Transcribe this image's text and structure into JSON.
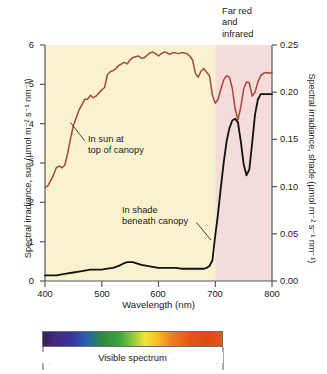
{
  "chart_data": {
    "type": "line",
    "title": "",
    "xlabel": "Wavelength (nm)",
    "ylabel": "Spectral irradiance, sun (µmol m⁻² s⁻¹ nm⁻¹)",
    "ylabel_right": "Spectral irradiance, shade (µmol m⁻² s⁻¹ nm⁻¹)",
    "xlim": [
      400,
      800
    ],
    "ylim": [
      0,
      6
    ],
    "ylim_right": [
      0.0,
      0.25
    ],
    "xticks": [
      400,
      500,
      600,
      700,
      800
    ],
    "xticklabels": [
      "400",
      "500",
      "600",
      "700",
      "800"
    ],
    "yticks": [
      0,
      1,
      2,
      3,
      4,
      5,
      6
    ],
    "yticklabels": [
      "0",
      "1",
      "2",
      "3",
      "4",
      "5",
      "6"
    ],
    "yticks_right": [
      0.0,
      0.05,
      0.1,
      0.15,
      0.2,
      0.25
    ],
    "yticklabels_right": [
      "0.00",
      "0.05",
      "0.10",
      "0.15",
      "0.20",
      "0.25"
    ],
    "grid": false,
    "legend_position": "inline-annotations",
    "series": [
      {
        "name": "In sun at top of canopy",
        "axis": "left",
        "color": "#a8443a",
        "x": [
          400,
          405,
          410,
          415,
          420,
          425,
          430,
          435,
          440,
          445,
          450,
          455,
          460,
          465,
          470,
          475,
          480,
          485,
          490,
          495,
          500,
          505,
          510,
          515,
          520,
          525,
          530,
          535,
          540,
          545,
          550,
          555,
          560,
          565,
          570,
          575,
          580,
          585,
          590,
          595,
          600,
          605,
          610,
          615,
          620,
          625,
          630,
          635,
          640,
          645,
          650,
          655,
          660,
          665,
          670,
          675,
          680,
          685,
          690,
          695,
          700,
          705,
          710,
          715,
          720,
          725,
          730,
          735,
          740,
          745,
          750,
          755,
          760,
          765,
          770,
          775,
          780,
          785,
          790,
          795,
          800
        ],
        "y": [
          2.38,
          2.42,
          2.55,
          2.7,
          2.88,
          2.92,
          2.88,
          2.95,
          3.25,
          3.62,
          3.95,
          4.15,
          4.35,
          4.48,
          4.62,
          4.62,
          4.72,
          4.66,
          4.7,
          4.78,
          4.86,
          4.92,
          5.25,
          5.32,
          5.35,
          5.4,
          5.48,
          5.52,
          5.56,
          5.52,
          5.62,
          5.68,
          5.7,
          5.72,
          5.66,
          5.68,
          5.74,
          5.8,
          5.82,
          5.78,
          5.72,
          5.78,
          5.82,
          5.8,
          5.76,
          5.8,
          5.8,
          5.78,
          5.8,
          5.8,
          5.78,
          5.72,
          5.62,
          5.28,
          5.18,
          5.34,
          5.4,
          5.3,
          5.22,
          4.72,
          4.52,
          4.62,
          4.88,
          5.12,
          5.22,
          5.18,
          4.9,
          4.38,
          4.1,
          4.42,
          4.88,
          5.06,
          5.04,
          4.7,
          4.8,
          5.05,
          5.22,
          5.28,
          5.3,
          5.28,
          5.3
        ]
      },
      {
        "name": "In shade beneath canopy",
        "axis": "right",
        "color": "#111111",
        "x": [
          400,
          410,
          420,
          430,
          440,
          450,
          460,
          470,
          480,
          490,
          500,
          510,
          520,
          530,
          540,
          545,
          550,
          555,
          560,
          570,
          580,
          590,
          600,
          610,
          620,
          630,
          640,
          650,
          660,
          670,
          675,
          680,
          685,
          690,
          695,
          700,
          705,
          710,
          715,
          720,
          725,
          730,
          735,
          740,
          745,
          750,
          755,
          760,
          765,
          770,
          775,
          780,
          785,
          790,
          795,
          800
        ],
        "y": [
          0.006,
          0.006,
          0.006,
          0.007,
          0.008,
          0.009,
          0.01,
          0.011,
          0.012,
          0.012,
          0.012,
          0.013,
          0.014,
          0.016,
          0.019,
          0.02,
          0.02,
          0.02,
          0.019,
          0.017,
          0.016,
          0.015,
          0.014,
          0.014,
          0.014,
          0.014,
          0.013,
          0.013,
          0.013,
          0.013,
          0.013,
          0.013,
          0.014,
          0.016,
          0.022,
          0.048,
          0.072,
          0.1,
          0.126,
          0.148,
          0.162,
          0.17,
          0.172,
          0.168,
          0.148,
          0.124,
          0.112,
          0.118,
          0.146,
          0.176,
          0.192,
          0.198,
          0.198,
          0.198,
          0.198,
          0.198
        ]
      }
    ],
    "regions": [
      {
        "name": "visible-band-shading",
        "x0": 400,
        "x1": 700,
        "color": "#f9f2cf"
      },
      {
        "name": "far-red-infrared-shading",
        "x0": 700,
        "x1": 800,
        "color": "#f4dcda"
      }
    ],
    "annotations": [
      {
        "name": "far-red-and-infrared",
        "lines": [
          "Far red",
          "and",
          "infrared"
        ]
      },
      {
        "name": "in-sun-at-top-of-canopy",
        "lines": [
          "In sun at",
          "top of canopy"
        ]
      },
      {
        "name": "in-shade-beneath-canopy",
        "lines": [
          "In shade",
          "beneath canopy"
        ]
      }
    ],
    "spectrum_strip": {
      "caption": "Visible spectrum",
      "range_nm": [
        400,
        700
      ],
      "colors": [
        "#3b1d5e",
        "#3636a0",
        "#2b5fb4",
        "#3aa03c",
        "#8cc63f",
        "#f2e33a",
        "#f7c32a",
        "#ef7d1e",
        "#dd4a18"
      ]
    }
  },
  "axes": {
    "left_title": "Spectral irradiance, sun (µmol m⁻² s⁻¹ nm⁻¹)",
    "right_title": "Spectral irradiance, shade (µmol m⁻² s⁻¹ nm⁻¹)",
    "x_title": "Wavelength (nm)",
    "left_ticks": [
      "6",
      "5",
      "4",
      "3",
      "2",
      "1",
      "0"
    ],
    "right_ticks": [
      "0.25",
      "0.20",
      "0.15",
      "0.10",
      "0.05",
      "0.00"
    ],
    "x_ticks": [
      "400",
      "500",
      "600",
      "700",
      "800"
    ]
  },
  "annotations": {
    "far_red_line1": "Far red",
    "far_red_line2": "and",
    "far_red_line3": "infrared",
    "sun_line1": "In sun at",
    "sun_line2": "top of canopy",
    "shade_line1": "In shade",
    "shade_line2": "beneath canopy"
  },
  "spectrum": {
    "caption": "Visible spectrum"
  },
  "colors": {
    "sun_curve": "#a8443a",
    "shade_curve": "#111111",
    "visible_band": "#f9f2cf",
    "far_red_band": "#f4dcda",
    "axis": "#55585c"
  }
}
